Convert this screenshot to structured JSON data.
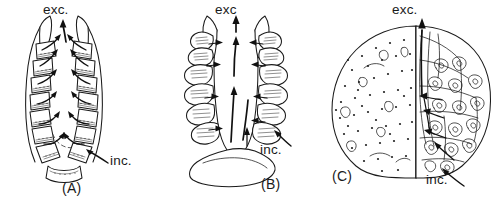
{
  "figure": {
    "caption_visible": false,
    "background_color": "#ffffff",
    "ink_color": "#1a1a1a",
    "width": 499,
    "height": 201
  },
  "panels": [
    {
      "id": "A",
      "name": "(A)",
      "description": "Schematic transverse section of a bivalve-type gill chamber with regularly segmented, rectangular plate-like lamellae arranged around a U-shaped mantle cavity; dashed inner outline marks the central water channel.",
      "labels": {
        "excurrent": "exc.",
        "incurrent": "inc."
      },
      "lamella_count": 16,
      "flow": "water drawn in ventrally at inc., passing between plates into the central cavity and expelled dorsally at exc."
    },
    {
      "id": "B",
      "name": "(B)",
      "description": "Section showing strongly folded, plicate lamellae forming looped tubules along both sides of a broad central excurrent channel seated on a basal plate.",
      "labels": {
        "excurrent": "exc",
        "incurrent": "inc."
      },
      "fold_count": 14,
      "flow": "water enters laterally through the folds and is driven up the wide median channel to exc."
    },
    {
      "id": "C",
      "name": "(C)",
      "description": "Half surface view (left, stippled) and half internal view (right) of a rounded organ with densely packed coiled tubular units feeding a median excurrent canal.",
      "labels": {
        "excurrent": "exc.",
        "incurrent": "inc."
      },
      "flow": "water enters ventrally at inc., percolates through the coiled tubule mass and leaves dorsally at exc."
    }
  ],
  "annotations": {
    "exc_a": "exc.",
    "inc_a": "inc.",
    "exc_b": "exc",
    "inc_b": "inc.",
    "exc_c": "exc.",
    "inc_c": "inc.",
    "name_a": "(A)",
    "name_b": "(B)",
    "name_c": "(C)"
  }
}
